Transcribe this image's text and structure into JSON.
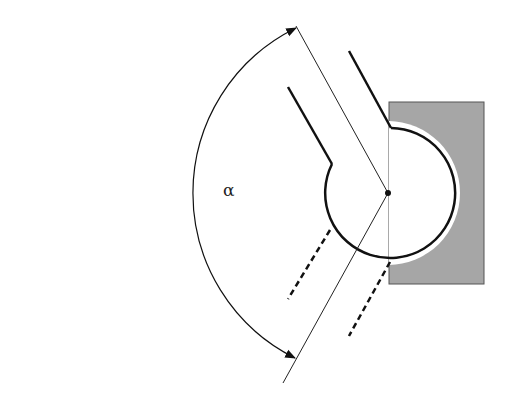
{
  "diagram": {
    "type": "joint-rotation-angle",
    "angle_label": "α",
    "colors": {
      "background": "#ffffff",
      "line": "#111111",
      "block_fill": "#a6a6a6",
      "block_stroke": "#555555",
      "gap": "#ffffff"
    },
    "pivot": {
      "x": 388,
      "y": 193
    },
    "ball_radius": 65,
    "socket_radius": 72,
    "arc_radius": 184
  }
}
